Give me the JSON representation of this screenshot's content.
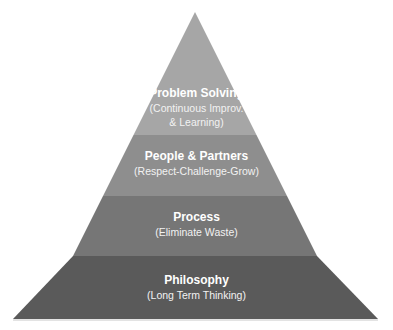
{
  "diagram": {
    "type": "pyramid",
    "levels": [
      {
        "title": "Problem Solving",
        "subtitle_lines": [
          "(Continuous Improv.",
          "& Learning)"
        ],
        "color": "#a6a6a6"
      },
      {
        "title": "People & Partners",
        "subtitle_lines": [
          "(Respect-Challenge-Grow)"
        ],
        "color": "#8c8c8c"
      },
      {
        "title": "Process",
        "subtitle_lines": [
          "(Eliminate Waste)"
        ],
        "color": "#737373"
      },
      {
        "title": "Philosophy",
        "subtitle_lines": [
          "(Long Term Thinking)"
        ],
        "color": "#595959"
      }
    ]
  }
}
